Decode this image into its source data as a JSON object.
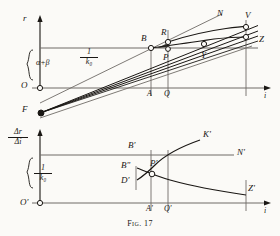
{
  "figure": {
    "caption": "Fig. 17",
    "number": "17"
  },
  "upper_plot": {
    "y_axis_label": "r",
    "x_axis_label": "i",
    "origin_label": "O",
    "bracket_label_numerator": "α+β",
    "slope_label_numerator": "1",
    "slope_label_denominator": "k₀",
    "points": [
      {
        "id": "O",
        "label": "O",
        "x": 32,
        "y": 88,
        "marker": "open"
      },
      {
        "id": "F",
        "label": "F",
        "x": 40,
        "y": 113,
        "marker": "filled"
      },
      {
        "id": "B",
        "label": "B",
        "x": 151,
        "y": 48,
        "marker": "open"
      },
      {
        "id": "R",
        "label": "R",
        "x": 168,
        "y": 42,
        "marker": "open"
      },
      {
        "id": "P",
        "label": "P",
        "x": 168,
        "y": 54,
        "marker": "open"
      },
      {
        "id": "Y",
        "label": "Y",
        "x": 204,
        "y": 50,
        "marker": "open"
      },
      {
        "id": "N",
        "label": "N",
        "x": 216,
        "y": 16,
        "marker": "none"
      },
      {
        "id": "V",
        "label": "V",
        "x": 246,
        "y": 26,
        "marker": "open"
      },
      {
        "id": "Z",
        "label": "Z",
        "x": 246,
        "y": 38,
        "marker": "open"
      },
      {
        "id": "A",
        "label": "A",
        "x": 151,
        "y": 88,
        "marker": "none"
      },
      {
        "id": "Q",
        "label": "Q",
        "x": 168,
        "y": 88,
        "marker": "none"
      }
    ],
    "axis_tick_labels": [
      "A",
      "Q"
    ]
  },
  "lower_plot": {
    "y_axis_label_numerator": "Δr",
    "y_axis_label_denominator": "Δi",
    "x_axis_label": "i",
    "origin_label": "O'",
    "slope_label_numerator": "1",
    "slope_label_denominator": "k₀",
    "points": [
      {
        "id": "Bp",
        "label": "B'",
        "x": 133,
        "y": 148,
        "marker": "none"
      },
      {
        "id": "Bpp",
        "label": "B\"",
        "x": 125,
        "y": 168,
        "marker": "none"
      },
      {
        "id": "Dp",
        "label": "D'",
        "x": 125,
        "y": 182,
        "marker": "none"
      },
      {
        "id": "Pp",
        "label": "P'",
        "x": 152,
        "y": 165,
        "marker": "open"
      },
      {
        "id": "Kp",
        "label": "K'",
        "x": 212,
        "y": 137,
        "marker": "none"
      },
      {
        "id": "Np",
        "label": "N'",
        "x": 238,
        "y": 155,
        "marker": "none"
      },
      {
        "id": "Zp",
        "label": "Z'",
        "x": 249,
        "y": 190,
        "marker": "none"
      },
      {
        "id": "Ap",
        "label": "A'",
        "x": 151,
        "y": 205,
        "marker": "none"
      },
      {
        "id": "Qp",
        "label": "Q'",
        "x": 168,
        "y": 205,
        "marker": "none"
      },
      {
        "id": "Op",
        "label": "O'",
        "x": 32,
        "y": 203,
        "marker": "open"
      }
    ],
    "axis_tick_labels": [
      "A'",
      "Q'"
    ]
  },
  "colors": {
    "ink": "#1a1714",
    "paper": "#fbfaf7",
    "rule": "#6f6b66"
  }
}
